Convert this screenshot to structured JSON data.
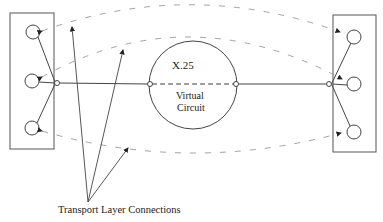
{
  "diagram": {
    "network": {
      "label_line1": "X.25",
      "label_line2": "Virtual",
      "label_line3": "Circuit"
    },
    "left_host": {
      "endpoints": 3
    },
    "right_host": {
      "endpoints": 3
    },
    "connections": [
      {
        "from": "left-endpoint-1",
        "to": "right-endpoint-1",
        "style": "dashed-arc"
      },
      {
        "from": "left-endpoint-2",
        "to": "right-endpoint-2",
        "style": "dashed-arc"
      },
      {
        "from": "left-endpoint-3",
        "to": "right-endpoint-3",
        "style": "dashed-arc"
      }
    ],
    "annotation": {
      "label": "Transport Layer Connections",
      "arrows": 3
    },
    "colors": {
      "line": "#444444",
      "dashed": "#888888",
      "background": "#ffffff"
    }
  }
}
